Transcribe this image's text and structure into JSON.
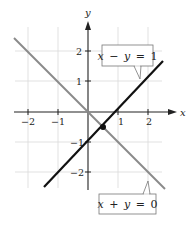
{
  "figure": {
    "type": "diagram",
    "axes": {
      "x_label": "x",
      "y_label": "y",
      "x_ticks": [
        {
          "value": -2,
          "label": "−2"
        },
        {
          "value": -1,
          "label": "−1"
        },
        {
          "value": 1,
          "label": "1"
        },
        {
          "value": 2,
          "label": "2"
        }
      ],
      "y_ticks": [
        {
          "value": 2,
          "label": "2"
        },
        {
          "value": 1,
          "label": "1"
        },
        {
          "value": -1,
          "label": "−1"
        },
        {
          "value": -2,
          "label": "−2"
        }
      ],
      "grid": true
    },
    "lines": [
      {
        "name": "x-minus-y-equals-1",
        "equation": "x − y = 1",
        "label_parts": [
          "x",
          "−",
          "y",
          "=",
          "1"
        ],
        "color": "#111111",
        "from": [
          -1.47,
          -2.47
        ],
        "to": [
          2.5,
          1.5
        ]
      },
      {
        "name": "x-plus-y-equals-0",
        "equation": "x + y = 0",
        "label_parts": [
          "x",
          "+",
          "y",
          "=",
          "0"
        ],
        "color": "#8a8a8a",
        "from": [
          -2.47,
          2.47
        ],
        "to": [
          2.57,
          -2.57
        ]
      }
    ],
    "intersection_point": [
      0.5,
      -0.5
    ],
    "colors": {
      "grid": "#d9d9d9",
      "axis": "#222222",
      "line_primary": "#111111",
      "line_secondary": "#8a8a8a",
      "callout_border": "#777777"
    }
  }
}
